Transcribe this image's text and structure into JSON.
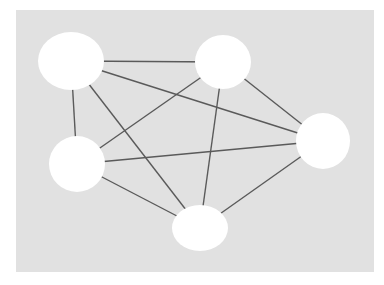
{
  "diagram": {
    "type": "graph",
    "background": {
      "x": 16,
      "y": 10,
      "width": 358,
      "height": 262,
      "color": "#e1e1e1"
    },
    "node_color": "#ffffff",
    "edge_color": "#5a5a5a",
    "nodes": [
      {
        "id": "A",
        "cx": 71,
        "cy": 61,
        "rx": 33,
        "ry": 29
      },
      {
        "id": "B",
        "cx": 223,
        "cy": 62,
        "rx": 28,
        "ry": 27
      },
      {
        "id": "C",
        "cx": 77,
        "cy": 164,
        "rx": 28,
        "ry": 28
      },
      {
        "id": "D",
        "cx": 323,
        "cy": 141,
        "rx": 27,
        "ry": 28
      },
      {
        "id": "E",
        "cx": 200,
        "cy": 228,
        "rx": 28,
        "ry": 23
      }
    ],
    "edges": [
      {
        "from": "A",
        "to": "B"
      },
      {
        "from": "A",
        "to": "C"
      },
      {
        "from": "A",
        "to": "D"
      },
      {
        "from": "A",
        "to": "E"
      },
      {
        "from": "B",
        "to": "C"
      },
      {
        "from": "B",
        "to": "D"
      },
      {
        "from": "B",
        "to": "E"
      },
      {
        "from": "C",
        "to": "D"
      },
      {
        "from": "C",
        "to": "E"
      },
      {
        "from": "D",
        "to": "E"
      }
    ]
  }
}
